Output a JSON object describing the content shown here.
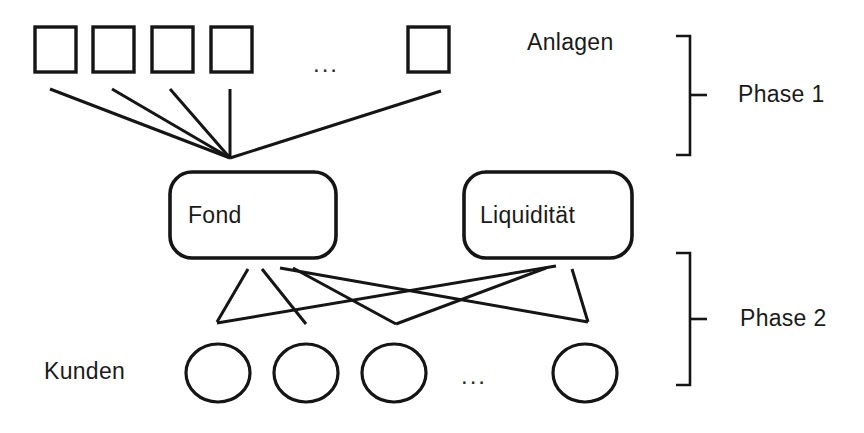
{
  "diagram": {
    "background_color": "#ffffff",
    "line_color": "#151515",
    "text_color": "#1a1a1a",
    "ellipsis": "...",
    "labels": {
      "assets_row": "Anlagen",
      "customers_row": "Kunden",
      "phase_one": "Phase 1",
      "phase_two": "Phase 2"
    },
    "nodes": {
      "fund": "Fond",
      "liquidity": "Liquidität"
    },
    "assets": {
      "shape": "square",
      "count_drawn": 5,
      "ellipsis_after": 4,
      "boxes": [
        {
          "x": 35,
          "y": 27,
          "w": 41,
          "h": 45
        },
        {
          "x": 93,
          "y": 27,
          "w": 41,
          "h": 45
        },
        {
          "x": 152,
          "y": 27,
          "w": 41,
          "h": 45
        },
        {
          "x": 211,
          "y": 27,
          "w": 41,
          "h": 45
        },
        {
          "x": 408,
          "y": 27,
          "w": 41,
          "h": 45
        }
      ],
      "ellipsis_pos": {
        "x": 320,
        "y": 70
      }
    },
    "customers": {
      "shape": "ellipse",
      "count_drawn": 4,
      "ellipsis_after": 3,
      "circles": [
        {
          "cx": 218,
          "cy": 373,
          "rx": 32,
          "ry": 29
        },
        {
          "cx": 306,
          "cy": 373,
          "rx": 32,
          "ry": 29
        },
        {
          "cx": 394,
          "cy": 373,
          "rx": 32,
          "ry": 29
        },
        {
          "cx": 585,
          "cy": 373,
          "rx": 32,
          "ry": 29
        }
      ],
      "ellipsis_pos": {
        "x": 468,
        "y": 382
      }
    },
    "fund_box": {
      "x": 170,
      "y": 172,
      "w": 166,
      "h": 86,
      "r": 22
    },
    "liquidity_box": {
      "x": 464,
      "y": 172,
      "w": 168,
      "h": 86,
      "r": 22
    },
    "phase1_edges": [
      {
        "from": "asset-1",
        "x1": 50,
        "y1": 89,
        "x2": 230,
        "y2": 158
      },
      {
        "from": "asset-2",
        "x1": 112,
        "y1": 89,
        "x2": 230,
        "y2": 158
      },
      {
        "from": "asset-3",
        "x1": 170,
        "y1": 89,
        "x2": 230,
        "y2": 158
      },
      {
        "from": "asset-4",
        "x1": 230,
        "y1": 89,
        "x2": 230,
        "y2": 158
      },
      {
        "from": "asset-5",
        "x1": 441,
        "y1": 91,
        "x2": 230,
        "y2": 158
      }
    ],
    "phase2_edges": [
      {
        "from": "fund",
        "to": "customer-1",
        "x1": 248,
        "y1": 269,
        "x2": 217,
        "y2": 322
      },
      {
        "from": "fund",
        "to": "customer-2",
        "x1": 262,
        "y1": 269,
        "x2": 306,
        "y2": 324
      },
      {
        "from": "fund",
        "to": "customer-4",
        "x1": 280,
        "y1": 268,
        "x2": 588,
        "y2": 322
      },
      {
        "from": "fund",
        "to": "customer-3-cross",
        "x1": 293,
        "y1": 268,
        "x2": 396,
        "y2": 324
      },
      {
        "from": "liquidity",
        "to": "customer-1-cross",
        "x1": 556,
        "y1": 266,
        "x2": 217,
        "y2": 323
      },
      {
        "from": "liquidity",
        "to": "customer-4",
        "x1": 572,
        "y1": 269,
        "x2": 588,
        "y2": 322
      },
      {
        "from": "liquidity",
        "to": "customer-3-cross",
        "x1": 546,
        "y1": 268,
        "x2": 396,
        "y2": 324
      }
    ],
    "brackets": {
      "phase1": {
        "x": 690,
        "y_top": 36,
        "y_bottom": 155,
        "tick_y": 95,
        "arm": 14,
        "tick_len": 16
      },
      "phase2": {
        "x": 690,
        "y_top": 253,
        "y_bottom": 385,
        "tick_y": 319,
        "arm": 14,
        "tick_len": 16
      }
    },
    "label_positions": {
      "assets_row": {
        "x": 527,
        "y": 33
      },
      "customers_row": {
        "x": 44,
        "y": 358
      },
      "phase_one": {
        "x": 738,
        "y": 82
      },
      "phase_two": {
        "x": 740,
        "y": 306
      }
    }
  }
}
